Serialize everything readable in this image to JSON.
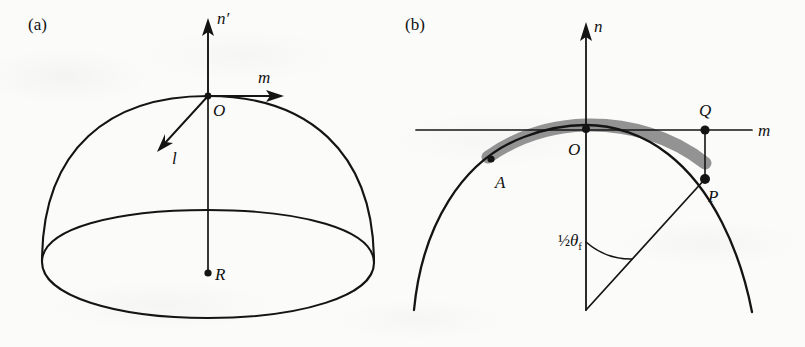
{
  "figure": {
    "background_color": "#fbfbfa",
    "ink_color": "#141414",
    "shaded_band_color": "#8a8a8a",
    "width": 805,
    "height": 347
  },
  "panels": [
    {
      "id": "a",
      "label": "(a)",
      "description": "Three-dimensional hemispherical dome with local orthonormal triad at apex",
      "axes": [
        {
          "name": "n-prime-axis",
          "label": "n′",
          "direction": "up",
          "arrow": true
        },
        {
          "name": "m-axis",
          "label": "m",
          "direction": "right",
          "arrow": true
        },
        {
          "name": "l-axis",
          "label": "l",
          "direction": "down-left",
          "arrow": true
        }
      ],
      "points": [
        {
          "name": "origin",
          "label": "O",
          "description": "apex of dome"
        },
        {
          "name": "center",
          "label": "R",
          "description": "center of sphere at base plane"
        }
      ],
      "shapes": [
        {
          "name": "dome-outline",
          "type": "hemisphere-arc"
        },
        {
          "name": "base-ellipse",
          "type": "ellipse"
        },
        {
          "name": "radius-line",
          "type": "line",
          "from": "O",
          "to": "R"
        }
      ]
    },
    {
      "id": "b",
      "label": "(b)",
      "description": "Two-dimensional cross-section of the dome with shaded deformed region",
      "axes": [
        {
          "name": "n-axis",
          "label": "n",
          "direction": "up",
          "arrow": true
        },
        {
          "name": "m-axis",
          "label": "m",
          "direction": "right",
          "arrow": false
        }
      ],
      "points": [
        {
          "name": "origin",
          "label": "O",
          "description": "apex of arc on n-axis"
        },
        {
          "name": "point-a",
          "label": "A",
          "description": "point on arc left of apex inside shaded band"
        },
        {
          "name": "point-p",
          "label": "P",
          "description": "point on arc right of apex"
        },
        {
          "name": "point-q",
          "label": "Q",
          "description": "projection of P onto m-axis"
        }
      ],
      "annotations": [
        {
          "name": "half-angle-label",
          "fraction": "½",
          "symbol": "θ",
          "subscript": "f",
          "full": "½θf",
          "description": "half of the fold angle measured from the n-axis to the radius OP"
        }
      ],
      "shapes": [
        {
          "name": "arc-outline",
          "type": "circular-arc"
        },
        {
          "name": "shaded-band",
          "type": "thick-arc-band"
        },
        {
          "name": "radius-to-p",
          "type": "line",
          "from": "sphere-center",
          "to": "P"
        },
        {
          "name": "drop-line-pq",
          "type": "line",
          "from": "P",
          "to": "Q"
        },
        {
          "name": "angle-arc",
          "type": "arc"
        }
      ]
    }
  ]
}
